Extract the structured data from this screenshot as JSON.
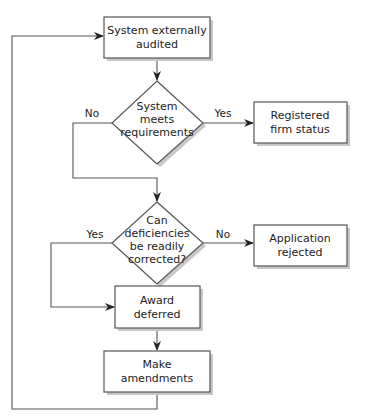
{
  "diagram": {
    "type": "flowchart",
    "colors": {
      "stroke": "#555555",
      "fill": "#ffffff",
      "shadow": "#c8c8c8",
      "text": "#222222"
    },
    "nodes": {
      "audit": {
        "shape": "rect",
        "line1": "System externally",
        "line2": "audited"
      },
      "meets": {
        "shape": "diamond",
        "line1": "System",
        "line2": "meets",
        "line3": "requirements"
      },
      "registered": {
        "shape": "rect",
        "line1": "Registered",
        "line2": "firm status"
      },
      "correct": {
        "shape": "diamond",
        "line1": "Can",
        "line2": "deficiencies",
        "line3": "be readily",
        "line4": "corrected?"
      },
      "rejected": {
        "shape": "rect",
        "line1": "Application",
        "line2": "rejected"
      },
      "deferred": {
        "shape": "rect",
        "line1": "Award",
        "line2": "deferred"
      },
      "amend": {
        "shape": "rect",
        "line1": "Make",
        "line2": "amendments"
      }
    },
    "edges": {
      "meets_no": {
        "from": "meets",
        "to": "correct",
        "label": "No"
      },
      "meets_yes": {
        "from": "meets",
        "to": "registered",
        "label": "Yes"
      },
      "correct_yes": {
        "from": "correct",
        "to": "deferred",
        "label": "Yes"
      },
      "correct_no": {
        "from": "correct",
        "to": "rejected",
        "label": "No"
      },
      "audit_to_meets": {
        "from": "audit",
        "to": "meets",
        "label": ""
      },
      "deferred_to_amend": {
        "from": "deferred",
        "to": "amend",
        "label": ""
      },
      "amend_to_audit": {
        "from": "amend",
        "to": "audit",
        "label": ""
      }
    }
  }
}
